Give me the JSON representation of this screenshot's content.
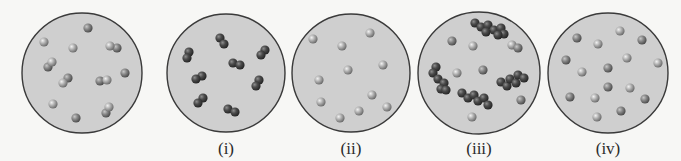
{
  "figure": {
    "colors": {
      "background": "#f7f7f5",
      "container_fill": "#cfcfcf",
      "container_stroke": "#3a3a3a",
      "light_atom": "#a9a9a9",
      "medium_atom": "#8a8a8a",
      "dark_atom": "#505050"
    },
    "panels": [
      {
        "id": "reference",
        "label": "",
        "cx": 82,
        "cy": 73,
        "r": 60,
        "atoms": [
          {
            "x": 88,
            "y": 28,
            "t": "medium"
          },
          {
            "x": 44,
            "y": 42,
            "t": "light"
          },
          {
            "x": 73,
            "y": 48,
            "t": "light"
          },
          {
            "x": 117,
            "y": 48,
            "t": "medium"
          },
          {
            "x": 110,
            "y": 46,
            "t": "light"
          },
          {
            "x": 48,
            "y": 67,
            "t": "medium"
          },
          {
            "x": 52,
            "y": 62,
            "t": "light"
          },
          {
            "x": 125,
            "y": 73,
            "t": "medium"
          },
          {
            "x": 68,
            "y": 78,
            "t": "medium"
          },
          {
            "x": 63,
            "y": 83,
            "t": "light"
          },
          {
            "x": 100,
            "y": 81,
            "t": "medium"
          },
          {
            "x": 107,
            "y": 80,
            "t": "light"
          },
          {
            "x": 53,
            "y": 104,
            "t": "light"
          },
          {
            "x": 106,
            "y": 113,
            "t": "medium"
          },
          {
            "x": 109,
            "y": 107,
            "t": "light"
          },
          {
            "x": 76,
            "y": 118,
            "t": "medium"
          }
        ]
      },
      {
        "id": "option-i",
        "label": "(i)",
        "cx": 226,
        "cy": 73,
        "r": 59,
        "atoms": [
          {
            "x": 220,
            "y": 38,
            "t": "dark"
          },
          {
            "x": 224,
            "y": 44,
            "t": "dark"
          },
          {
            "x": 189,
            "y": 52,
            "t": "dark"
          },
          {
            "x": 187,
            "y": 58,
            "t": "dark"
          },
          {
            "x": 265,
            "y": 50,
            "t": "dark"
          },
          {
            "x": 261,
            "y": 55,
            "t": "dark"
          },
          {
            "x": 233,
            "y": 63,
            "t": "dark"
          },
          {
            "x": 240,
            "y": 65,
            "t": "dark"
          },
          {
            "x": 202,
            "y": 76,
            "t": "dark"
          },
          {
            "x": 196,
            "y": 79,
            "t": "dark"
          },
          {
            "x": 259,
            "y": 80,
            "t": "dark"
          },
          {
            "x": 256,
            "y": 86,
            "t": "dark"
          },
          {
            "x": 203,
            "y": 98,
            "t": "dark"
          },
          {
            "x": 198,
            "y": 103,
            "t": "dark"
          },
          {
            "x": 228,
            "y": 109,
            "t": "dark"
          },
          {
            "x": 235,
            "y": 112,
            "t": "dark"
          }
        ]
      },
      {
        "id": "option-ii",
        "label": "(ii)",
        "cx": 351,
        "cy": 73,
        "r": 59,
        "atoms": [
          {
            "x": 313,
            "y": 39,
            "t": "light"
          },
          {
            "x": 370,
            "y": 33,
            "t": "light"
          },
          {
            "x": 342,
            "y": 46,
            "t": "light"
          },
          {
            "x": 383,
            "y": 65,
            "t": "light"
          },
          {
            "x": 348,
            "y": 70,
            "t": "light"
          },
          {
            "x": 319,
            "y": 80,
            "t": "light"
          },
          {
            "x": 372,
            "y": 95,
            "t": "light"
          },
          {
            "x": 321,
            "y": 102,
            "t": "light"
          },
          {
            "x": 387,
            "y": 107,
            "t": "light"
          },
          {
            "x": 359,
            "y": 111,
            "t": "light"
          },
          {
            "x": 340,
            "y": 118,
            "t": "light"
          }
        ]
      },
      {
        "id": "option-iii",
        "label": "(iii)",
        "cx": 479,
        "cy": 73,
        "r": 61,
        "atoms": [
          {
            "x": 475,
            "y": 23,
            "t": "dark"
          },
          {
            "x": 481,
            "y": 27,
            "t": "dark"
          },
          {
            "x": 488,
            "y": 25,
            "t": "dark"
          },
          {
            "x": 494,
            "y": 30,
            "t": "dark"
          },
          {
            "x": 501,
            "y": 28,
            "t": "dark"
          },
          {
            "x": 504,
            "y": 34,
            "t": "dark"
          },
          {
            "x": 486,
            "y": 32,
            "t": "dark"
          },
          {
            "x": 498,
            "y": 35,
            "t": "dark"
          },
          {
            "x": 452,
            "y": 41,
            "t": "medium"
          },
          {
            "x": 473,
            "y": 46,
            "t": "light"
          },
          {
            "x": 512,
            "y": 45,
            "t": "light"
          },
          {
            "x": 518,
            "y": 48,
            "t": "medium"
          },
          {
            "x": 436,
            "y": 67,
            "t": "dark"
          },
          {
            "x": 433,
            "y": 73,
            "t": "dark"
          },
          {
            "x": 438,
            "y": 79,
            "t": "dark"
          },
          {
            "x": 444,
            "y": 83,
            "t": "dark"
          },
          {
            "x": 441,
            "y": 89,
            "t": "dark"
          },
          {
            "x": 446,
            "y": 90,
            "t": "dark"
          },
          {
            "x": 457,
            "y": 73,
            "t": "light"
          },
          {
            "x": 483,
            "y": 70,
            "t": "medium"
          },
          {
            "x": 501,
            "y": 82,
            "t": "dark"
          },
          {
            "x": 507,
            "y": 86,
            "t": "dark"
          },
          {
            "x": 510,
            "y": 79,
            "t": "dark"
          },
          {
            "x": 516,
            "y": 83,
            "t": "dark"
          },
          {
            "x": 518,
            "y": 75,
            "t": "dark"
          },
          {
            "x": 524,
            "y": 78,
            "t": "dark"
          },
          {
            "x": 462,
            "y": 93,
            "t": "dark"
          },
          {
            "x": 468,
            "y": 98,
            "t": "dark"
          },
          {
            "x": 474,
            "y": 95,
            "t": "dark"
          },
          {
            "x": 478,
            "y": 101,
            "t": "dark"
          },
          {
            "x": 484,
            "y": 98,
            "t": "dark"
          },
          {
            "x": 488,
            "y": 105,
            "t": "dark"
          },
          {
            "x": 521,
            "y": 100,
            "t": "medium"
          },
          {
            "x": 472,
            "y": 117,
            "t": "light"
          }
        ]
      },
      {
        "id": "option-iv",
        "label": "(iv)",
        "cx": 608,
        "cy": 73,
        "r": 60,
        "atoms": [
          {
            "x": 620,
            "y": 31,
            "t": "light"
          },
          {
            "x": 577,
            "y": 38,
            "t": "medium"
          },
          {
            "x": 642,
            "y": 40,
            "t": "medium"
          },
          {
            "x": 598,
            "y": 44,
            "t": "light"
          },
          {
            "x": 627,
            "y": 58,
            "t": "light"
          },
          {
            "x": 566,
            "y": 60,
            "t": "medium"
          },
          {
            "x": 658,
            "y": 63,
            "t": "light"
          },
          {
            "x": 608,
            "y": 68,
            "t": "medium"
          },
          {
            "x": 582,
            "y": 72,
            "t": "light"
          },
          {
            "x": 608,
            "y": 87,
            "t": "medium"
          },
          {
            "x": 630,
            "y": 88,
            "t": "light"
          },
          {
            "x": 570,
            "y": 97,
            "t": "medium"
          },
          {
            "x": 595,
            "y": 98,
            "t": "light"
          },
          {
            "x": 645,
            "y": 99,
            "t": "medium"
          },
          {
            "x": 621,
            "y": 111,
            "t": "medium"
          },
          {
            "x": 597,
            "y": 117,
            "t": "light"
          }
        ]
      }
    ]
  }
}
